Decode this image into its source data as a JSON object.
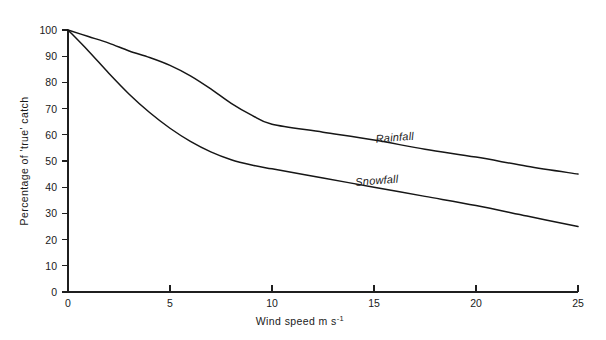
{
  "chart_data": {
    "type": "line",
    "title": "",
    "subtitle": "",
    "xlabel": "Wind speed m s",
    "xlabel_exponent": "-1",
    "ylabel": "Percentage of 'true' catch",
    "xlim": [
      0,
      25
    ],
    "ylim": [
      0,
      100
    ],
    "xticks": [
      0,
      5,
      10,
      15,
      20,
      25
    ],
    "xtick_labels": [
      "0",
      "5",
      "10",
      "15",
      "20",
      "25"
    ],
    "yticks": [
      0,
      10,
      20,
      30,
      40,
      50,
      60,
      70,
      80,
      90,
      100
    ],
    "ytick_labels": [
      "0",
      "10",
      "20",
      "30",
      "40",
      "50",
      "60",
      "70",
      "80",
      "90",
      "100"
    ],
    "grid": false,
    "legend_position": "inline-annotations",
    "x": [
      0,
      1,
      2,
      3,
      4,
      5,
      6,
      7,
      8,
      9,
      10,
      12.5,
      15,
      17.5,
      20,
      22.5,
      25
    ],
    "series": [
      {
        "name": "Rainfall",
        "label": "Rainfall",
        "color": "#161616",
        "values": [
          100,
          97.5,
          95,
          92,
          89.5,
          86.5,
          82.5,
          77.5,
          72,
          67.5,
          64,
          61,
          58,
          54.5,
          51.5,
          48,
          45
        ]
      },
      {
        "name": "Snowfall",
        "label": "Snowfall",
        "color": "#161616",
        "values": [
          100,
          92,
          83.5,
          75.5,
          68.5,
          62.5,
          57.5,
          53.5,
          50.5,
          48.5,
          47,
          43.5,
          40,
          36.5,
          33,
          29,
          25
        ]
      }
    ],
    "annotations": [
      {
        "text": "Rainfall",
        "x": 15.1,
        "y": 57,
        "rotation": -4.5
      },
      {
        "text": "Snowfall",
        "x": 14.1,
        "y": 40.5,
        "rotation": -4.5
      }
    ]
  },
  "colors": {
    "background": "#ffffff",
    "axis": "#1f1f1f",
    "curve": "#161616",
    "text": "#1a1a1a"
  }
}
